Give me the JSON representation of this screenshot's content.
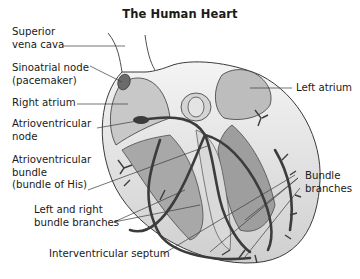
{
  "title": "The Human Heart",
  "labels": {
    "superior_vena_cava": [
      "Superior",
      "vena cava"
    ],
    "sinoatrial_node": [
      "Sinoatrial node",
      "(pacemaker)"
    ],
    "right_atrium": [
      "Right atrium"
    ],
    "atrioventricular_node": [
      "Atrioventricular",
      "node"
    ],
    "atrioventricular_bundle": [
      "Atrioventricular",
      "bundle",
      "(bundle of His)"
    ],
    "left_right_bundle_branches": [
      "Left and right",
      "bundle branches"
    ],
    "interventricular_septum": [
      "Interventricular septum"
    ],
    "left_atrium": [
      "Left atrium"
    ],
    "bundle_branches": [
      "Bundle",
      "branches"
    ]
  },
  "colors": {
    "outline": "#3a3a3a",
    "fill_light": "#e2e2e2",
    "fill_mid": "#bdbdbd",
    "fill_dark": "#8e8e8e",
    "conduction": "#3c3c3c",
    "node": "#6b6b6b"
  }
}
